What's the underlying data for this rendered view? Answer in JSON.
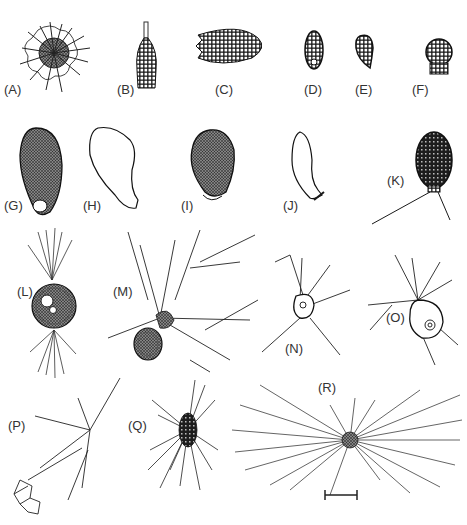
{
  "figure": {
    "panels": [
      {
        "id": "A",
        "label": "(A)",
        "description": "spiny spherical shell with radiating spines"
      },
      {
        "id": "B",
        "label": "(B)",
        "description": "flask-shaped shell with neck, reticulate pattern"
      },
      {
        "id": "C",
        "label": "(C)",
        "description": "elongate oval reticulate shell"
      },
      {
        "id": "D",
        "label": "(D)",
        "description": "small oval shell with plates and aperture"
      },
      {
        "id": "E",
        "label": "(E)",
        "description": "small curved shell with plates"
      },
      {
        "id": "F",
        "label": "(F)",
        "description": "rounded shell with collar"
      },
      {
        "id": "G",
        "label": "(G)",
        "description": "stippled ovoid shell with terminal aperture"
      },
      {
        "id": "H",
        "label": "(H)",
        "description": "smooth outline flask shell"
      },
      {
        "id": "I",
        "label": "(I)",
        "description": "granular ovoid shell with aperture"
      },
      {
        "id": "J",
        "label": "(J)",
        "description": "smooth elongate shell with lip"
      },
      {
        "id": "K",
        "label": "(K)",
        "description": "dark reticulate ovoid shell with filopodia"
      },
      {
        "id": "L",
        "label": "(L)",
        "description": "spherical cell with bipolar pseudopodia"
      },
      {
        "id": "M",
        "label": "(M)",
        "description": "test with branching reticulopodia"
      },
      {
        "id": "N",
        "label": "(N)",
        "description": "small cell with branching pseudopodia"
      },
      {
        "id": "O",
        "label": "(O)",
        "description": "cell with branching pseudopodia"
      },
      {
        "id": "P",
        "label": "(P)",
        "description": "branching network cell"
      },
      {
        "id": "Q",
        "label": "(Q)",
        "description": "cell with dense radiating pseudopodia"
      },
      {
        "id": "R",
        "label": "(R)",
        "description": "reticulose network radiating from central body"
      }
    ],
    "scale_bar": {
      "label": ""
    }
  }
}
